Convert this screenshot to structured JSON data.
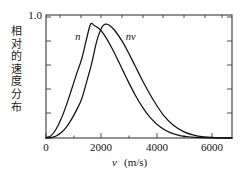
{
  "figure": {
    "background": "#ffffff",
    "axis_color": "#3a3a3a",
    "curve_color": "#111111",
    "text_color": "#111111"
  },
  "axes": {
    "y_label_cn": "相对的速度分布",
    "y_ticks": [
      "1.0"
    ],
    "x_ticks": [
      "0",
      "2000",
      "4000",
      "6000"
    ],
    "x_title_symbol": "v",
    "x_title_units": "(m/s)"
  },
  "chart_data": {
    "type": "line",
    "title": "",
    "xlabel": "v (m/s)",
    "ylabel": "相对的速度分布",
    "xlim": [
      0,
      7300
    ],
    "ylim": [
      0,
      1.08
    ],
    "xticks": [
      0,
      2000,
      4000,
      6000
    ],
    "yticks": [
      1.0
    ],
    "grid": false,
    "legend": "inline-labels",
    "minor_ticks": true,
    "frame": "box",
    "series": [
      {
        "name": "n",
        "label": "n",
        "label_x": 1250,
        "label_y": 0.86,
        "peak_x": 1750,
        "peak_y": 1.0,
        "x": [
          0,
          200,
          400,
          600,
          800,
          1000,
          1200,
          1400,
          1600,
          1750,
          1900,
          2100,
          2300,
          2600,
          2900,
          3200,
          3500,
          3800,
          4100,
          4500,
          4900,
          5300,
          5700,
          6100,
          6500,
          6900,
          7300
        ],
        "y": [
          0.0,
          0.021,
          0.079,
          0.171,
          0.289,
          0.424,
          0.563,
          0.694,
          0.878,
          1.0,
          0.988,
          0.957,
          0.901,
          0.784,
          0.648,
          0.508,
          0.378,
          0.266,
          0.177,
          0.094,
          0.045,
          0.019,
          0.008,
          0.003,
          0.001,
          0.0,
          0.0
        ]
      },
      {
        "name": "nv",
        "label": "nv",
        "label_x": 3320,
        "label_y": 0.86,
        "peak_x": 2350,
        "peak_y": 1.0,
        "x": [
          0,
          200,
          400,
          600,
          800,
          1000,
          1200,
          1400,
          1600,
          1800,
          2000,
          2200,
          2350,
          2500,
          2700,
          3000,
          3300,
          3600,
          3900,
          4200,
          4600,
          5000,
          5400,
          5800,
          6200,
          6600,
          7000,
          7300
        ],
        "y": [
          0.0,
          0.004,
          0.018,
          0.048,
          0.096,
          0.163,
          0.247,
          0.343,
          0.497,
          0.662,
          0.857,
          0.975,
          1.0,
          0.988,
          0.944,
          0.846,
          0.721,
          0.587,
          0.456,
          0.338,
          0.203,
          0.112,
          0.056,
          0.025,
          0.01,
          0.004,
          0.001,
          0.0
        ]
      }
    ]
  }
}
